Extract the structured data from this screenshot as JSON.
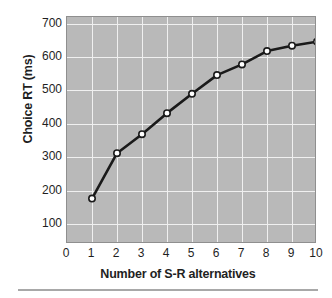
{
  "chart_data": {
    "type": "line",
    "title": "",
    "xlabel": "Number of S-R alternatives",
    "ylabel": "Choice RT (ms)",
    "x": [
      1,
      2,
      3,
      4,
      5,
      6,
      7,
      8,
      9,
      10
    ],
    "values": [
      176,
      312,
      369,
      432,
      490,
      546,
      578,
      618,
      634,
      646
    ],
    "series": [
      {
        "name": "Choice RT",
        "x": [
          1,
          2,
          3,
          4,
          5,
          6,
          7,
          8,
          9,
          10
        ],
        "values": [
          176,
          312,
          369,
          432,
          490,
          546,
          578,
          618,
          634,
          646
        ]
      }
    ],
    "xlim": [
      0,
      10
    ],
    "ylim": [
      40,
      720
    ],
    "xticks": [
      0,
      1,
      2,
      3,
      4,
      5,
      6,
      7,
      8,
      9,
      10
    ],
    "yticks": [
      100,
      200,
      300,
      400,
      500,
      600,
      700
    ],
    "xtick_labels": [
      "0",
      "1",
      "2",
      "3",
      "4",
      "5",
      "6",
      "7",
      "8",
      "9",
      "10"
    ],
    "ytick_labels": [
      "100",
      "200",
      "300",
      "400",
      "500",
      "600",
      "700"
    ],
    "grid": true,
    "legend": false,
    "legend_position": "none",
    "marker": "open-circle",
    "colors": {
      "plot_background": "#b9b9b9",
      "gridline": "#f0f0f0",
      "line": "#1a1a1a",
      "marker_fill": "#ffffff",
      "marker_edge": "#1a1a1a",
      "axis_border": "#8f8f8f",
      "text": "#1f1f1f",
      "rule": "#a8a8a8",
      "page_background": "#ffffff"
    }
  }
}
